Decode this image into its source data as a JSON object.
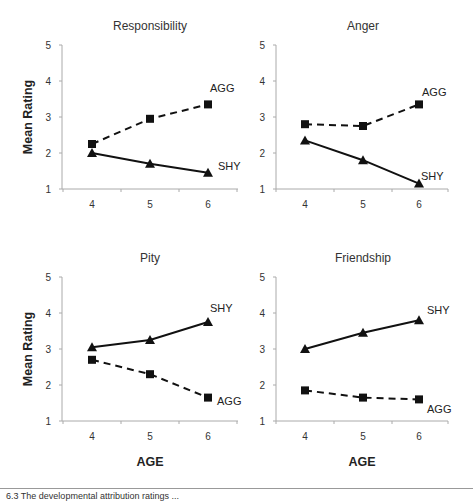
{
  "chart_data": [
    {
      "type": "line",
      "title": "Responsibility",
      "xlabel": "",
      "ylabel": "Mean Rating",
      "categories": [
        "4",
        "5",
        "6"
      ],
      "ylim": [
        1,
        5
      ],
      "yticks": [
        1,
        2,
        3,
        4,
        5
      ],
      "grid": false,
      "series": [
        {
          "name": "AGG",
          "style": "dashed",
          "marker": "square",
          "values": [
            2.25,
            2.95,
            3.35
          ]
        },
        {
          "name": "SHY",
          "style": "solid",
          "marker": "triangle",
          "values": [
            2.0,
            1.7,
            1.45
          ]
        }
      ]
    },
    {
      "type": "line",
      "title": "Anger",
      "xlabel": "",
      "ylabel": "",
      "categories": [
        "4",
        "5",
        "6"
      ],
      "ylim": [
        1,
        5
      ],
      "yticks": [
        1,
        2,
        3,
        4,
        5
      ],
      "grid": false,
      "series": [
        {
          "name": "AGG",
          "style": "dashed",
          "marker": "square",
          "values": [
            2.8,
            2.75,
            3.35
          ]
        },
        {
          "name": "SHY",
          "style": "solid",
          "marker": "triangle",
          "values": [
            2.35,
            1.8,
            1.15
          ]
        }
      ]
    },
    {
      "type": "line",
      "title": "Pity",
      "xlabel": "AGE",
      "ylabel": "Mean Rating",
      "categories": [
        "4",
        "5",
        "6"
      ],
      "ylim": [
        1,
        5
      ],
      "yticks": [
        1,
        2,
        3,
        4,
        5
      ],
      "grid": false,
      "series": [
        {
          "name": "SHY",
          "style": "solid",
          "marker": "triangle",
          "values": [
            3.05,
            3.25,
            3.75
          ]
        },
        {
          "name": "AGG",
          "style": "dashed",
          "marker": "square",
          "values": [
            2.7,
            2.3,
            1.65
          ]
        }
      ]
    },
    {
      "type": "line",
      "title": "Friendship",
      "xlabel": "AGE",
      "ylabel": "",
      "categories": [
        "4",
        "5",
        "6"
      ],
      "ylim": [
        1,
        5
      ],
      "yticks": [
        1,
        2,
        3,
        4,
        5
      ],
      "grid": false,
      "series": [
        {
          "name": "SHY",
          "style": "solid",
          "marker": "triangle",
          "values": [
            3.0,
            3.45,
            3.8
          ]
        },
        {
          "name": "AGG",
          "style": "dashed",
          "marker": "square",
          "values": [
            1.85,
            1.65,
            1.6
          ]
        }
      ]
    }
  ],
  "layout": {
    "panels": [
      {
        "axis_x": 62,
        "x_right": 238,
        "y_top": 45,
        "y_bottom": 189,
        "cat_x": [
          92,
          150,
          208
        ],
        "label_pos": {
          "AGG": [
            210,
            92
          ],
          "SHY": [
            218,
            170
          ]
        },
        "title_x": 150,
        "title_y": 30,
        "ylabel": true,
        "xlabel": false
      },
      {
        "axis_x": 276,
        "x_right": 448,
        "y_top": 45,
        "y_bottom": 189,
        "cat_x": [
          305,
          363,
          419
        ],
        "label_pos": {
          "AGG": [
            422,
            96
          ],
          "SHY": [
            421,
            180
          ]
        },
        "title_x": 363,
        "title_y": 30,
        "ylabel": false,
        "xlabel": false
      },
      {
        "axis_x": 62,
        "x_right": 238,
        "y_top": 277,
        "y_bottom": 421,
        "cat_x": [
          92,
          150,
          208
        ],
        "label_pos": {
          "SHY": [
            210,
            312
          ],
          "AGG": [
            217,
            405
          ]
        },
        "title_x": 150,
        "title_y": 262,
        "ylabel": true,
        "xlabel": true
      },
      {
        "axis_x": 276,
        "x_right": 448,
        "y_top": 277,
        "y_bottom": 421,
        "cat_x": [
          305,
          363,
          419
        ],
        "label_pos": {
          "SHY": [
            427,
            314
          ],
          "AGG": [
            427,
            413
          ]
        },
        "title_x": 363,
        "title_y": 262,
        "ylabel": false,
        "xlabel": true
      }
    ]
  },
  "caption": "6.3 The developmental attribution ratings ..."
}
